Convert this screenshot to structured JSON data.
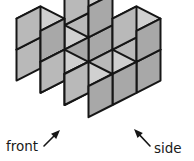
{
  "figure": {
    "kind": "isometric-cube-solid",
    "background_color": "#ffffff",
    "geometry": {
      "origin_x": 88.5,
      "origin_y": 44.0,
      "half_width": 24.0,
      "half_depth": 12.2,
      "cube_height": 31.0
    },
    "cube_positions": [
      {
        "x": 0,
        "y": 0,
        "z": 0
      },
      {
        "x": 0,
        "y": 0,
        "z": 1
      },
      {
        "x": 0,
        "y": 1,
        "z": 0
      },
      {
        "x": 0,
        "y": 2,
        "z": 0
      },
      {
        "x": 1,
        "y": 2,
        "z": 0
      },
      {
        "x": 2,
        "y": 2,
        "z": 0
      },
      {
        "x": 2,
        "y": 1,
        "z": 0
      },
      {
        "x": 2,
        "y": 0,
        "z": 0
      },
      {
        "x": 2,
        "y": 0,
        "z": 1
      },
      {
        "x": 0,
        "y": 2,
        "z": 1
      }
    ],
    "cube_count": 10,
    "colors": {
      "top_face": "#d0d0d0",
      "left_face": "#b9b9b9",
      "right_face": "#a8a8a8",
      "edge_stroke": "#161616",
      "gap_fill": "#ffffff"
    },
    "edge_width": 2.0
  },
  "annotations": {
    "front": {
      "label": "front",
      "text_x": 6,
      "text_y": 151,
      "arrow_from_x": 44,
      "arrow_from_y": 146,
      "arrow_to_x": 60,
      "arrow_to_y": 130
    },
    "side": {
      "label": "side",
      "text_x": 154,
      "text_y": 153,
      "arrow_from_x": 150,
      "arrow_from_y": 146,
      "arrow_to_x": 134,
      "arrow_to_y": 129
    }
  }
}
